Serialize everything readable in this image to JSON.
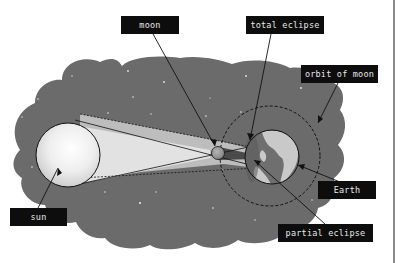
{
  "diagram": {
    "labels": {
      "moon": "moon",
      "total_eclipse": "total eclipse",
      "orbit_of_moon": "orbit of moon",
      "sun": "sun",
      "earth": "Earth",
      "partial_eclipse": "partial eclipse"
    },
    "colors": {
      "background": "#ffffff",
      "space": "#6b6b6b",
      "sun_fill": "#e6e6e6",
      "penumbra": "#bdbdbd",
      "umbra": "#dedede",
      "earth_ocean": "#6f6f6f",
      "earth_land": "#c9c9c9",
      "moon_fill": "#9a9a9a",
      "label_bg": "#0d0d0d",
      "label_text": "#e8e8e8",
      "stroke": "#111111"
    }
  }
}
